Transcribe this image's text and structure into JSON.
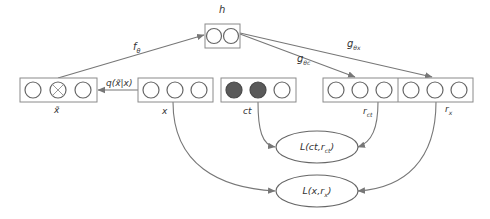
{
  "diagram": {
    "type": "neural-network-architecture",
    "colors": {
      "edge": "#777777",
      "box_border": "#8a8a8a",
      "node_border": "#666666",
      "filled_node": "#5a5a5a",
      "background": "#ffffff"
    },
    "layers": {
      "h": {
        "label": "h",
        "units": 2
      },
      "x_tilde": {
        "label": "x̃",
        "units": 3,
        "corrupted_unit_index": 1
      },
      "x": {
        "label": "x",
        "units": 3
      },
      "ct": {
        "label": "ct",
        "units": 3,
        "filled_units": 2
      },
      "r_ct": {
        "label": "r",
        "sub": "ct",
        "units": 3
      },
      "r_x": {
        "label": "r",
        "sub": "x",
        "units": 3
      }
    },
    "edges": {
      "f_theta": {
        "label": "f",
        "sub": "θ",
        "from": "x_tilde",
        "to": "h"
      },
      "q": {
        "label": "q(x̃|x)",
        "from": "x",
        "to": "x_tilde"
      },
      "g_theta_c": {
        "label": "g",
        "sub": "θc",
        "from": "h",
        "to": "r_ct"
      },
      "g_theta_x": {
        "label": "g",
        "sub": "θx",
        "from": "h",
        "to": "r_x"
      }
    },
    "losses": {
      "l_ct": {
        "prefix": "L(ct,r",
        "sub": "ct",
        "suffix": ")"
      },
      "l_x": {
        "prefix": "L(x,r",
        "sub": "x",
        "suffix": ")"
      }
    }
  }
}
